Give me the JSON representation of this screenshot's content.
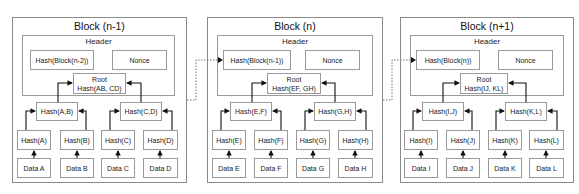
{
  "blocks": [
    {
      "title": "Block (n-1)",
      "header": {
        "title": "Header",
        "prev_hash": "Hash(Block(n-2))",
        "nonce": "Nonce",
        "root_label": "Root",
        "root_hash": "Hash(AB, CD)"
      },
      "pair_hashes": [
        "Hash(A,B)",
        "Hash(C,D)"
      ],
      "leaf_hashes": [
        "Hash(A)",
        "Hash(B)",
        "Hash(C)",
        "Hash(D)"
      ],
      "data": [
        "Data A",
        "Data B",
        "Data C",
        "Data D"
      ]
    },
    {
      "title": "Block (n)",
      "header": {
        "title": "Header",
        "prev_hash": "Hash(Block(n-1))",
        "nonce": "Nonce",
        "root_label": "Root",
        "root_hash": "Hash(EF, GH)"
      },
      "pair_hashes": [
        "Hash(E,F)",
        "Hash(G,H)"
      ],
      "leaf_hashes": [
        "Hash(E)",
        "Hash(F)",
        "Hash(G)",
        "Hash(H)"
      ],
      "data": [
        "Data E",
        "Data F",
        "Data G",
        "Data H"
      ]
    },
    {
      "title": "Block (n+1)",
      "header": {
        "title": "Header",
        "prev_hash": "Hash(Block(n))",
        "nonce": "Nonce",
        "root_label": "Root",
        "root_hash": "Hash(IJ, KL)"
      },
      "pair_hashes": [
        "Hash(I,J)",
        "Hash(K,L)"
      ],
      "leaf_hashes": [
        "Hash(I)",
        "Hash(J)",
        "Hash(K)",
        "Hash(L)"
      ],
      "data": [
        "Data I",
        "Data J",
        "Data K",
        "Data L"
      ]
    }
  ],
  "colors": {
    "box_border": "#9a9a9a",
    "arrow": "#111111",
    "dotted_link": "#777777"
  }
}
